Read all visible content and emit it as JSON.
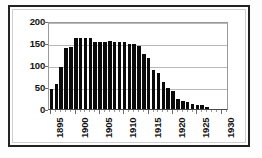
{
  "chart_data": {
    "type": "bar",
    "title": "",
    "subtitle": "",
    "xlabel": "",
    "ylabel": "",
    "xlim": [
      1894.5,
      1931.5
    ],
    "ylim": [
      0,
      200
    ],
    "grid": true,
    "legend": null,
    "bar_color": "#0a0a0a",
    "gridline_color": "#b8b8b8",
    "frame_color": "#222222",
    "y_ticks": [
      0,
      50,
      100,
      150,
      200
    ],
    "y_tick_labels": [
      "0",
      "50",
      "100",
      "150",
      "200"
    ],
    "x_ticks": [
      1895,
      1900,
      1905,
      1910,
      1915,
      1920,
      1925,
      1930
    ],
    "x_tick_labels": [
      "1895",
      "1900",
      "1905",
      "1910",
      "1915",
      "1920",
      "1925",
      "1930"
    ],
    "categories": [
      1895,
      1896,
      1897,
      1898,
      1899,
      1900,
      1901,
      1902,
      1903,
      1904,
      1905,
      1906,
      1907,
      1908,
      1909,
      1910,
      1911,
      1912,
      1913,
      1914,
      1915,
      1916,
      1917,
      1918,
      1919,
      1920,
      1921,
      1922,
      1923,
      1924,
      1925,
      1926,
      1927
    ],
    "values": [
      46,
      57,
      96,
      139,
      140,
      161,
      161,
      162,
      161,
      152,
      153,
      152,
      155,
      153,
      152,
      152,
      147,
      147,
      143,
      126,
      115,
      88,
      82,
      62,
      48,
      40,
      23,
      19,
      15,
      11,
      9,
      8,
      5
    ]
  }
}
